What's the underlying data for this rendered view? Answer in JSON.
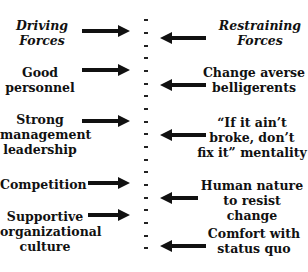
{
  "diagram": {
    "headers": {
      "driving": "Driving\nForces",
      "restraining": "Restraining\nForces"
    },
    "driving_forces": [
      "Good\npersonnel",
      "Strong\nmanagement\nleadership",
      "Competition",
      "Supportive\norganizational\nculture"
    ],
    "restraining_forces": [
      "Change averse\nbelligerents",
      "“If it ain’t\nbroke, don’t\nfix it” mentality",
      "Human nature\nto resist change",
      "Comfort with\nstatus quo"
    ],
    "colors": {
      "ink": "#111111",
      "background": "#ffffff"
    }
  }
}
